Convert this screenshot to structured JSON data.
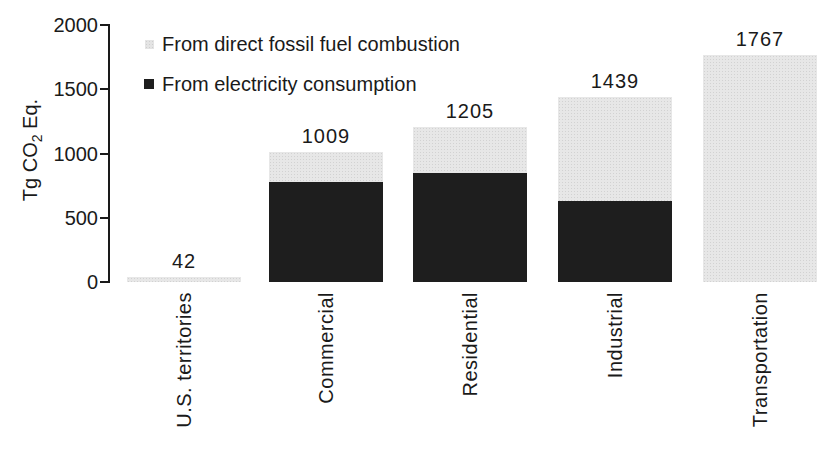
{
  "figure": {
    "background": "#ffffff",
    "text_color": "#1a1a1a"
  },
  "chart_data": {
    "type": "bar",
    "stacked": true,
    "title": "",
    "ylabel_parts": {
      "prefix": "Tg CO",
      "sub": "2",
      "suffix": " Eq."
    },
    "ylabel_plain": "Tg CO2 Eq.",
    "ylim": [
      0,
      2000
    ],
    "yticks": [
      "0",
      "500",
      "1000",
      "1500",
      "2000"
    ],
    "grid": false,
    "categories": [
      "U.S. territories",
      "Commercial",
      "Residential",
      "Industrial",
      "Transportation"
    ],
    "totals": [
      42,
      1009,
      1205,
      1439,
      1767
    ],
    "total_labels": [
      "42",
      "1009",
      "1205",
      "1439",
      "1767"
    ],
    "series": [
      {
        "name": "From electricity consumption",
        "color": "#1e1e1e",
        "values": [
          0,
          778,
          846,
          630,
          0
        ]
      },
      {
        "name": "From direct fossil fuel combustion",
        "color": "#e4e4e4",
        "values": [
          42,
          231,
          359,
          809,
          1767
        ]
      }
    ],
    "legend": [
      {
        "label": "From direct fossil fuel combustion",
        "color": "#e4e4e4"
      },
      {
        "label": "From electricity consumption",
        "color": "#1e1e1e"
      }
    ],
    "legend_position": "top-left-inside"
  }
}
